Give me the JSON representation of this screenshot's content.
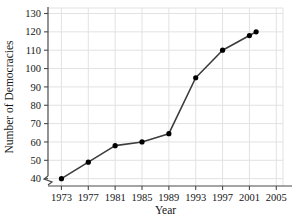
{
  "chart_data": {
    "type": "line",
    "title": "",
    "xlabel": "Year",
    "ylabel": "Number of Democracies",
    "x": [
      1973,
      1977,
      1981,
      1985,
      1989,
      1993,
      1997,
      2001,
      2002
    ],
    "values": [
      40,
      49,
      58,
      60,
      64.5,
      95,
      110,
      118,
      120
    ],
    "series": [
      {
        "name": "Number of Democracies",
        "x": [
          1973,
          1977,
          1981,
          1985,
          1989,
          1993,
          1997,
          2001,
          2002
        ],
        "values": [
          40,
          49,
          58,
          60,
          64.5,
          95,
          110,
          118,
          120
        ]
      }
    ],
    "xlim": [
      1971,
      2006
    ],
    "ylim": [
      36,
      133
    ],
    "xticks": [
      1973,
      1977,
      1981,
      1985,
      1989,
      1993,
      1997,
      2001,
      2005
    ],
    "xtick_labels": [
      "1973",
      "1977",
      "1981",
      "1985",
      "1989",
      "1993",
      "1997",
      "2001",
      "2005"
    ],
    "yticks": [
      40,
      50,
      60,
      70,
      80,
      90,
      100,
      110,
      120,
      130
    ],
    "ytick_labels": [
      "40",
      "50",
      "60",
      "70",
      "80",
      "90",
      "100",
      "110",
      "120",
      "130"
    ],
    "grid": true,
    "grid_color": "#e2e2e2",
    "legend": "none",
    "y_axis_break": true,
    "marker": "filled-circle",
    "line_color": "#3c3c3c",
    "marker_color": "#000000",
    "axis_color": "#4a4a4a"
  }
}
